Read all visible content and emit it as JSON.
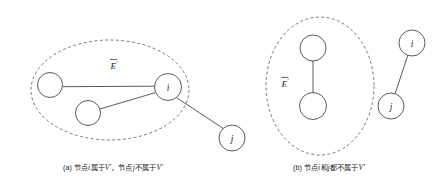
{
  "figure": {
    "background_color": "#ffffff",
    "stroke_color": "#4a4a4a",
    "dashed_stroke_color": "#6a6a6a",
    "panels": [
      {
        "id": "panel-a",
        "caption_prefix": "(a)",
        "caption_text_1": "节点",
        "caption_italic_1": "i",
        "caption_text_2": "属于",
        "caption_italic_2": "V′",
        "caption_text_3": "，节点",
        "caption_italic_3": "j",
        "caption_text_4": "不属于",
        "caption_italic_4": "V′",
        "caption_full": "(a) 节点i属于V′，节点j不属于V′",
        "group_label": "E",
        "group_label_prime": "′",
        "group_label_full": "Ē′",
        "group_ellipse": {
          "cx": 110,
          "cy": 90,
          "rx": 79,
          "ry": 50
        },
        "nodes": [
          {
            "id": "a-n1",
            "label": "",
            "cx": 50,
            "cy": 85,
            "r": 12.5,
            "inside_group": true
          },
          {
            "id": "a-n2",
            "label": "",
            "cx": 88,
            "cy": 113,
            "r": 12.5,
            "inside_group": true
          },
          {
            "id": "a-i",
            "label": "i",
            "cx": 168,
            "cy": 87,
            "r": 13.5,
            "inside_group": true
          },
          {
            "id": "a-j",
            "label": "j",
            "cx": 232,
            "cy": 138,
            "r": 13,
            "inside_group": false
          }
        ],
        "edges": [
          {
            "from": "a-n1",
            "to": "a-i"
          },
          {
            "from": "a-n2",
            "to": "a-i"
          },
          {
            "from": "a-i",
            "to": "a-j"
          }
        ]
      },
      {
        "id": "panel-b",
        "caption_prefix": "(b)",
        "caption_text_1": "节点",
        "caption_italic_1": "i",
        "caption_text_2": "和",
        "caption_italic_2": "j",
        "caption_text_3": "都不属于",
        "caption_italic_3": "V′",
        "caption_full": "(b) 节点i和j都不属于V′",
        "group_label": "E",
        "group_label_prime": "′",
        "group_label_full": "Ē′",
        "group_ellipse": {
          "cx": 320,
          "cy": 86,
          "rx": 54,
          "ry": 69
        },
        "nodes": [
          {
            "id": "b-n1",
            "label": "",
            "cx": 313,
            "cy": 48,
            "r": 13,
            "inside_group": true
          },
          {
            "id": "b-n2",
            "label": "",
            "cx": 313,
            "cy": 106,
            "r": 13.5,
            "inside_group": true
          },
          {
            "id": "b-i",
            "label": "i",
            "cx": 412,
            "cy": 43,
            "r": 13,
            "inside_group": false
          },
          {
            "id": "b-j",
            "label": "j",
            "cx": 391,
            "cy": 106,
            "r": 13,
            "inside_group": false
          }
        ],
        "edges": [
          {
            "from": "b-n1",
            "to": "b-n2"
          },
          {
            "from": "b-i",
            "to": "b-j"
          }
        ]
      }
    ]
  }
}
